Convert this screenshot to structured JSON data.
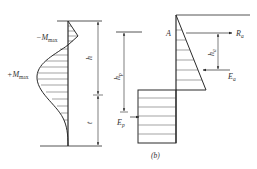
{
  "left_diagram": {
    "neg_moment_label": "−M",
    "neg_moment_sub": "max",
    "pos_moment_label": "+M",
    "pos_moment_sub": "max",
    "dim_upper_label": "h",
    "dim_lower_label": "t"
  },
  "right_diagram": {
    "point_label": "A",
    "anchor_force_label": "R",
    "anchor_force_sub": "a",
    "active_force_label": "E",
    "active_force_sub": "a",
    "anchor_dim_label": "h",
    "anchor_dim_sub": "a",
    "passive_dim_label": "h",
    "passive_dim_sub": "p",
    "passive_force_label": "E",
    "passive_force_sub": "p",
    "caption": "(b)"
  },
  "colors": {
    "line": "#2a2a2a",
    "hatch": "#555555",
    "text": "#333333"
  }
}
